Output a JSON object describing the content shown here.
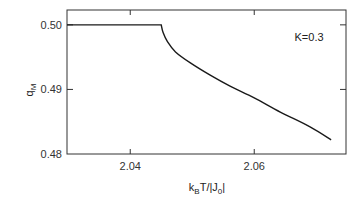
{
  "chart_data": {
    "type": "line",
    "title": "",
    "xlabel": "k_B T/|J_0|",
    "ylabel": "q_M",
    "xlim": [
      2.0298,
      2.0748
    ],
    "ylim": [
      0.48,
      0.5023
    ],
    "xticks": [
      2.04,
      2.06
    ],
    "xtick_labels": [
      "2.04",
      "2.06"
    ],
    "yticks": [
      0.48,
      0.49,
      0.5
    ],
    "ytick_labels": [
      "0.48",
      "0.49",
      "0.50"
    ],
    "grid": false,
    "annotations": [
      {
        "text": "K=0.3",
        "x": 2.0665,
        "y": 0.4975
      }
    ],
    "series": [
      {
        "name": "q_M",
        "color": "#1a1a1a",
        "x": [
          2.0298,
          2.045,
          2.0453,
          2.046,
          2.0473,
          2.0497,
          2.0529,
          2.0561,
          2.06,
          2.0642,
          2.069,
          2.0724
        ],
        "y": [
          0.5,
          0.5,
          0.4988,
          0.4974,
          0.4958,
          0.4941,
          0.4922,
          0.4905,
          0.4887,
          0.4865,
          0.4842,
          0.4822
        ]
      }
    ]
  }
}
